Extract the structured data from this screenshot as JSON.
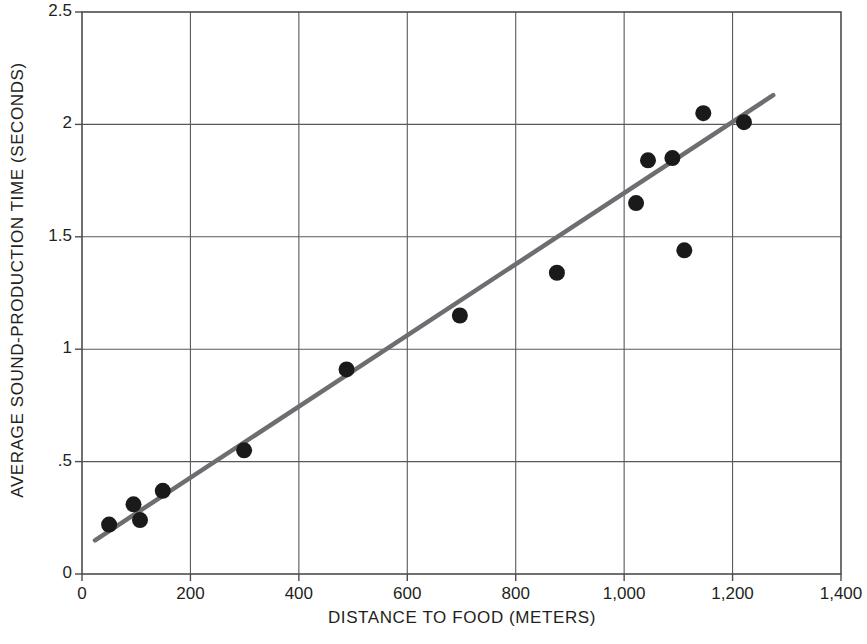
{
  "chart_data": {
    "type": "scatter",
    "title": "",
    "xlabel": "DISTANCE TO FOOD (METERS)",
    "ylabel": "AVERAGE SOUND-PRODUCTION TIME (SECONDS)",
    "xlim": [
      0,
      1400
    ],
    "ylim": [
      0,
      2.5
    ],
    "xticks": [
      0,
      200,
      400,
      600,
      800,
      1000,
      1200,
      1400
    ],
    "xticklabels": [
      "0",
      "200",
      "400",
      "600",
      "800",
      "1,000",
      "1,200",
      "1,400"
    ],
    "yticks": [
      0,
      0.5,
      1,
      1.5,
      2,
      2.5
    ],
    "yticklabels": [
      "0",
      ".5",
      "1",
      "1.5",
      "2",
      "2.5"
    ],
    "grid": true,
    "grid_color": "#58595b",
    "legend": null,
    "point_color": "#1a1a1a",
    "point_radius": 8,
    "line_color": "#6d6e71",
    "points": [
      {
        "x": 50,
        "y": 0.22
      },
      {
        "x": 95,
        "y": 0.31
      },
      {
        "x": 107,
        "y": 0.24
      },
      {
        "x": 149,
        "y": 0.37
      },
      {
        "x": 299,
        "y": 0.55
      },
      {
        "x": 488,
        "y": 0.91
      },
      {
        "x": 697,
        "y": 1.15
      },
      {
        "x": 876,
        "y": 1.34
      },
      {
        "x": 1022,
        "y": 1.65
      },
      {
        "x": 1044,
        "y": 1.84
      },
      {
        "x": 1089,
        "y": 1.85
      },
      {
        "x": 1111,
        "y": 1.44
      },
      {
        "x": 1146,
        "y": 2.05
      },
      {
        "x": 1221,
        "y": 2.01
      }
    ],
    "fit_line": {
      "label": "regression-line",
      "x_start": 24,
      "y_start": 0.15,
      "x_end": 1275,
      "y_end": 2.13
    }
  }
}
